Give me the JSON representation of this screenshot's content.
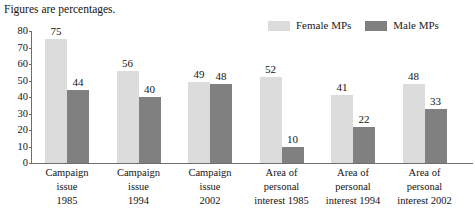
{
  "note": "Figures are percentages.",
  "legend": {
    "position": "top-right",
    "items": [
      {
        "label": "Female MPs",
        "color": "#dcdcdc",
        "swatch_name": "legend-swatch-female"
      },
      {
        "label": "Male MPs",
        "color": "#808080",
        "swatch_name": "legend-swatch-male"
      }
    ]
  },
  "axis": {
    "y_ticks": [
      "0",
      "10",
      "20",
      "30",
      "40",
      "50",
      "60",
      "70",
      "80"
    ]
  },
  "chart_data": {
    "type": "bar",
    "title": "Figures are percentages.",
    "xlabel": "",
    "ylabel": "",
    "ylim": [
      0,
      80
    ],
    "ytick_step": 10,
    "grid": false,
    "legend_position": "top-right",
    "categories": [
      "Campaign issue 1985",
      "Campaign issue 1994",
      "Campaign issue 2002",
      "Area of personal interest 1985",
      "Area of personal interest 1994",
      "Area of personal interest 2002"
    ],
    "category_lines": [
      [
        "Campaign",
        "issue",
        "1985"
      ],
      [
        "Campaign",
        "issue",
        "1994"
      ],
      [
        "Campaign",
        "issue",
        "2002"
      ],
      [
        "Area of",
        "personal",
        "interest 1985"
      ],
      [
        "Area of",
        "personal",
        "interest 1994"
      ],
      [
        "Area of",
        "personal",
        "interest 2002"
      ]
    ],
    "series": [
      {
        "name": "Female MPs",
        "color": "#dcdcdc",
        "values": [
          75,
          56,
          49,
          52,
          41,
          48
        ]
      },
      {
        "name": "Male MPs",
        "color": "#808080",
        "values": [
          44,
          40,
          48,
          10,
          22,
          33
        ]
      }
    ]
  }
}
